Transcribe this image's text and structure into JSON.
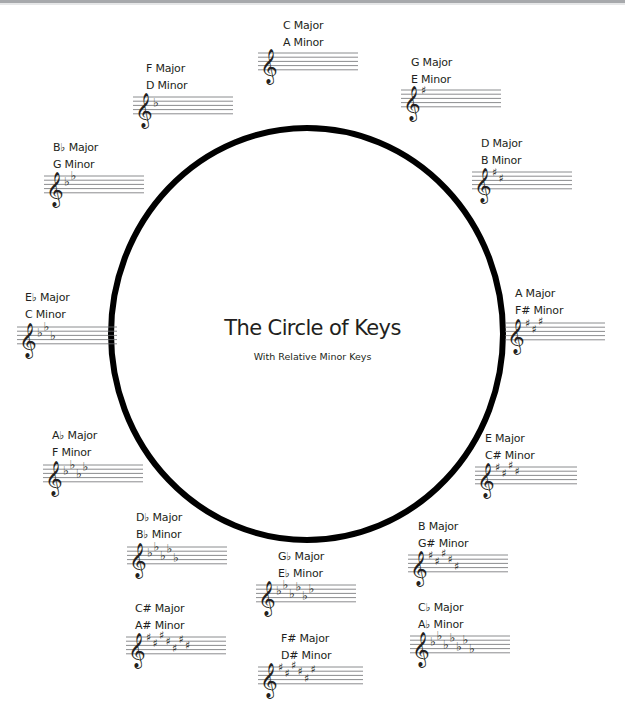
{
  "title": "The Circle of Keys",
  "subtitle": "With Relative Minor Keys",
  "colors": {
    "ink": "#231f20",
    "staff_line": "#6d6e71",
    "circle": "#000000",
    "top_bar": "#a7a9ac"
  },
  "circle": {
    "cx": 307,
    "cy": 334,
    "rx": 196,
    "ry": 206,
    "stroke_width": 6
  },
  "keys": [
    {
      "major": "C Major",
      "minor": "A Minor",
      "accidental": "none",
      "count": 0,
      "label_x": 283,
      "label_y": 17,
      "staff_x": 258,
      "staff_y": 53,
      "staff_w": 100
    },
    {
      "major": "G Major",
      "minor": "E Minor",
      "accidental": "sharp",
      "count": 1,
      "label_x": 411,
      "label_y": 54,
      "staff_x": 401,
      "staff_y": 90,
      "staff_w": 100
    },
    {
      "major": "D Major",
      "minor": "B Minor",
      "accidental": "sharp",
      "count": 2,
      "label_x": 481,
      "label_y": 135,
      "staff_x": 472,
      "staff_y": 172,
      "staff_w": 100
    },
    {
      "major": "A Major",
      "minor": "F# Minor",
      "accidental": "sharp",
      "count": 3,
      "label_x": 515,
      "label_y": 285,
      "staff_x": 505,
      "staff_y": 323,
      "staff_w": 100
    },
    {
      "major": "E Major",
      "minor": "C# Minor",
      "accidental": "sharp",
      "count": 4,
      "label_x": 485,
      "label_y": 430,
      "staff_x": 475,
      "staff_y": 467,
      "staff_w": 102
    },
    {
      "major": "B Major",
      "minor": "G# Minor",
      "accidental": "sharp",
      "count": 5,
      "label_x": 418,
      "label_y": 518,
      "staff_x": 408,
      "staff_y": 555,
      "staff_w": 100
    },
    {
      "major": "Cb Major",
      "minor": "Ab Minor",
      "accidental": "flat",
      "count": 7,
      "label_x": 418,
      "label_y": 599,
      "staff_x": 410,
      "staff_y": 636,
      "staff_w": 100
    },
    {
      "major": "F# Major",
      "minor": "D# Minor",
      "accidental": "sharp",
      "count": 6,
      "label_x": 281,
      "label_y": 630,
      "staff_x": 258,
      "staff_y": 667,
      "staff_w": 105
    },
    {
      "major": "Gb Major",
      "minor": "Eb Minor",
      "accidental": "flat",
      "count": 6,
      "label_x": 278,
      "label_y": 548,
      "staff_x": 256,
      "staff_y": 585,
      "staff_w": 100
    },
    {
      "major": "C# Major",
      "minor": "A# Minor",
      "accidental": "sharp",
      "count": 7,
      "label_x": 135,
      "label_y": 600,
      "staff_x": 126,
      "staff_y": 637,
      "staff_w": 100
    },
    {
      "major": "Db Major",
      "minor": "Bb Minor",
      "accidental": "flat",
      "count": 5,
      "label_x": 136,
      "label_y": 509,
      "staff_x": 127,
      "staff_y": 547,
      "staff_w": 100
    },
    {
      "major": "Ab Major",
      "minor": "F Minor",
      "accidental": "flat",
      "count": 4,
      "label_x": 52,
      "label_y": 427,
      "staff_x": 43,
      "staff_y": 465,
      "staff_w": 100
    },
    {
      "major": "Eb Major",
      "minor": "C Minor",
      "accidental": "flat",
      "count": 3,
      "label_x": 25,
      "label_y": 289,
      "staff_x": 17,
      "staff_y": 327,
      "staff_w": 100
    },
    {
      "major": "Bb Major",
      "minor": "G Minor",
      "accidental": "flat",
      "count": 2,
      "label_x": 53,
      "label_y": 139,
      "staff_x": 44,
      "staff_y": 176,
      "staff_w": 100
    },
    {
      "major": "F Major",
      "minor": "D Minor",
      "accidental": "flat",
      "count": 1,
      "label_x": 146,
      "label_y": 60,
      "staff_x": 133,
      "staff_y": 97,
      "staff_w": 100
    }
  ],
  "glyphs": {
    "treble_clef": "𝄞",
    "sharp": "♯",
    "flat": "♭"
  }
}
